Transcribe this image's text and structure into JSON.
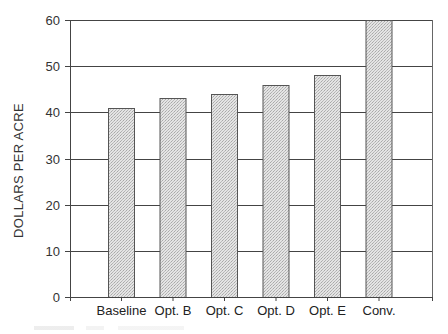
{
  "chart_data": {
    "type": "bar",
    "title": "",
    "xlabel": "",
    "ylabel": "DOLLARS PER ACRE",
    "categories": [
      "Baseline",
      "Opt. B",
      "Opt. C",
      "Opt. D",
      "Opt. E",
      "Conv."
    ],
    "values": [
      41,
      43,
      44,
      46,
      48,
      60
    ],
    "ylim": [
      0,
      60
    ],
    "yticks": [
      0,
      10,
      20,
      30,
      40,
      50,
      60
    ],
    "grid": true,
    "legend": null,
    "bar_fill": "#d9d9d9",
    "bar_edge": "#555555"
  },
  "axis": {
    "ylabel": "DOLLARS PER ACRE",
    "yticks": [
      "0",
      "10",
      "20",
      "30",
      "40",
      "50",
      "60"
    ]
  },
  "categories": [
    "Baseline",
    "Opt. B",
    "Opt. C",
    "Opt. D",
    "Opt. E",
    "Conv."
  ]
}
